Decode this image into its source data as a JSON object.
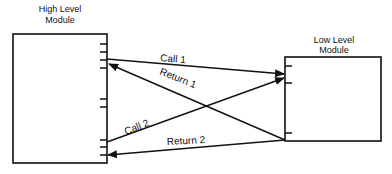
{
  "diagram": {
    "high_module": {
      "title_line1": "High Level",
      "title_line2": "Module"
    },
    "low_module": {
      "title_line1": "Low Level",
      "title_line2": "Module"
    },
    "arrows": [
      {
        "label": "Call 1",
        "from": "High Level Module",
        "to": "Low Level Module"
      },
      {
        "label": "Return 1",
        "from": "Low Level Module",
        "to": "High Level Module"
      },
      {
        "label": "Call 2",
        "from": "High Level Module",
        "to": "Low Level Module"
      },
      {
        "label": "Return 2",
        "from": "Low Level Module",
        "to": "High Level Module"
      }
    ],
    "colors": {
      "stroke": "#111111",
      "background": "#ffffff"
    }
  }
}
